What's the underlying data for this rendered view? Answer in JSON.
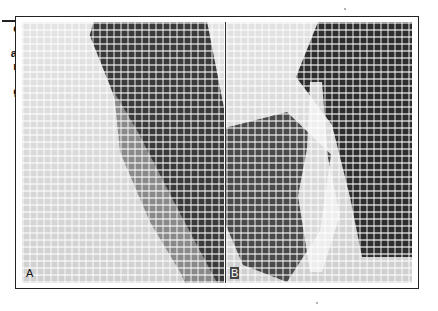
{
  "caption_fragment": {
    "lines": [
      "d",
      "r",
      "al",
      "n",
      "-",
      "g"
    ]
  },
  "figure": {
    "panels": [
      {
        "id": "A",
        "label": "A",
        "description": "radiograph panel A, grayscale halftone"
      },
      {
        "id": "B",
        "label": "B",
        "description": "radiograph panel B, grayscale halftone"
      }
    ]
  },
  "colors": {
    "frame": "#222222",
    "dark_region": "#2e2e2e",
    "background": "#ffffff"
  }
}
